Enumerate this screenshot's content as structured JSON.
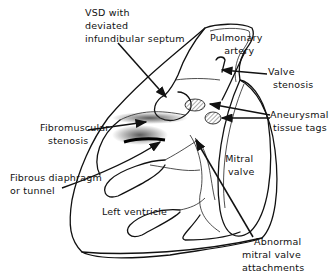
{
  "diagram": {
    "labels": {
      "vsd": [
        "VSD with",
        "deviated",
        "infundibular septum"
      ],
      "pulmonary_artery": [
        "Pulmonary",
        "artery"
      ],
      "valve_stenosis": [
        "Valve",
        "stenosis"
      ],
      "fibromuscular_stenosis": [
        "Fibromuscular",
        "stenosis"
      ],
      "aneurysmal_tissue_tags": [
        "Aneurysmal",
        "tissue tags"
      ],
      "fibrous_diaphragm": [
        "Fibrous diaphragm",
        "or tunnel"
      ],
      "mitral_valve": [
        "Mitral",
        "valve"
      ],
      "left_ventricle": [
        "Left ventricle"
      ],
      "abnormal_mitral": [
        "Abnormal",
        "mitral valve",
        "attachments"
      ]
    },
    "colors": {
      "ink": "#111111",
      "background": "#ffffff",
      "hatch": "#888888"
    }
  }
}
